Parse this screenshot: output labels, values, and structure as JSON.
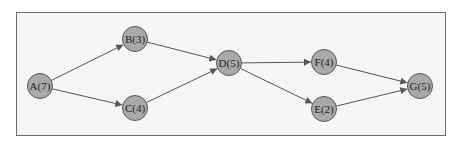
{
  "diagram": {
    "type": "activity-network",
    "colors": {
      "node_fill": "#a9a9a9",
      "node_stroke": "#555555",
      "edge": "#555555",
      "frame_bg": "#f6f6f6",
      "frame_border": "#6e6e6e"
    },
    "nodes": [
      {
        "id": "A",
        "label": "A(7)",
        "duration": 7,
        "x": 40,
        "y": 86
      },
      {
        "id": "B",
        "label": "B(3)",
        "duration": 3,
        "x": 135,
        "y": 39
      },
      {
        "id": "C",
        "label": "C(4)",
        "duration": 4,
        "x": 135,
        "y": 108
      },
      {
        "id": "D",
        "label": "D(5)",
        "duration": 5,
        "x": 229,
        "y": 63
      },
      {
        "id": "F",
        "label": "F(4)",
        "duration": 4,
        "x": 324,
        "y": 62
      },
      {
        "id": "E",
        "label": "E(2)",
        "duration": 2,
        "x": 324,
        "y": 109
      },
      {
        "id": "G",
        "label": "G(5)",
        "duration": 5,
        "x": 420,
        "y": 86
      }
    ],
    "edges": [
      {
        "from": "A",
        "to": "B"
      },
      {
        "from": "A",
        "to": "C"
      },
      {
        "from": "B",
        "to": "D"
      },
      {
        "from": "C",
        "to": "D"
      },
      {
        "from": "D",
        "to": "F"
      },
      {
        "from": "D",
        "to": "E"
      },
      {
        "from": "F",
        "to": "G"
      },
      {
        "from": "E",
        "to": "G"
      }
    ]
  }
}
